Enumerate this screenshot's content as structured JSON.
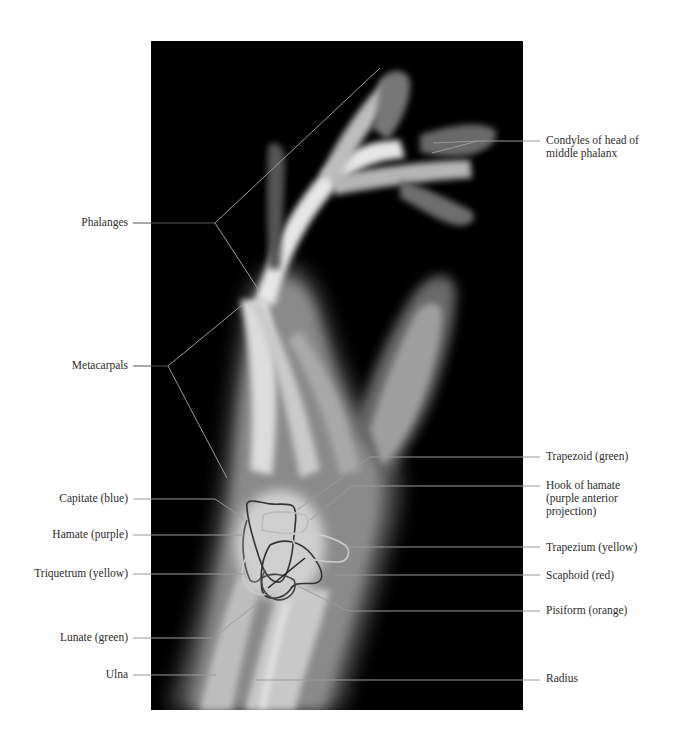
{
  "figure": {
    "type": "lateral hand radiograph, annotated",
    "background_color": "#ffffff",
    "xray_frame_color": "#000000",
    "leader_line_color": "#9a9a9a",
    "outline_color": "#3a3a3a"
  },
  "labels": {
    "left": [
      {
        "id": "phalanges",
        "text": "Phalanges",
        "x": 128,
        "y": 223
      },
      {
        "id": "metacarpals",
        "text": "Metacarpals",
        "x": 128,
        "y": 366
      },
      {
        "id": "capitate",
        "text": "Capitate (blue)",
        "x": 128,
        "y": 499
      },
      {
        "id": "hamate",
        "text": "Hamate (purple)",
        "x": 128,
        "y": 535
      },
      {
        "id": "triquetrum",
        "text": "Triquetrum (yellow)",
        "x": 128,
        "y": 574
      },
      {
        "id": "lunate",
        "text": "Lunate (green)",
        "x": 128,
        "y": 638
      },
      {
        "id": "ulna",
        "text": "Ulna",
        "x": 128,
        "y": 675
      }
    ],
    "right": [
      {
        "id": "condyles",
        "text": "Condyles of head of\nmiddle phalanx",
        "x": 546,
        "y": 140
      },
      {
        "id": "trapezoid",
        "text": "Trapezoid (green)",
        "x": 546,
        "y": 456
      },
      {
        "id": "hook-of-hamate",
        "text": "Hook of hamate\n(purple anterior\nprojection)",
        "x": 546,
        "y": 484
      },
      {
        "id": "trapezium",
        "text": "Trapezium (yellow)",
        "x": 546,
        "y": 547
      },
      {
        "id": "scaphoid",
        "text": "Scaphoid (red)",
        "x": 546,
        "y": 575
      },
      {
        "id": "pisiform",
        "text": "Pisiform (orange)",
        "x": 546,
        "y": 610
      },
      {
        "id": "radius",
        "text": "Radius",
        "x": 546,
        "y": 678
      }
    ]
  }
}
